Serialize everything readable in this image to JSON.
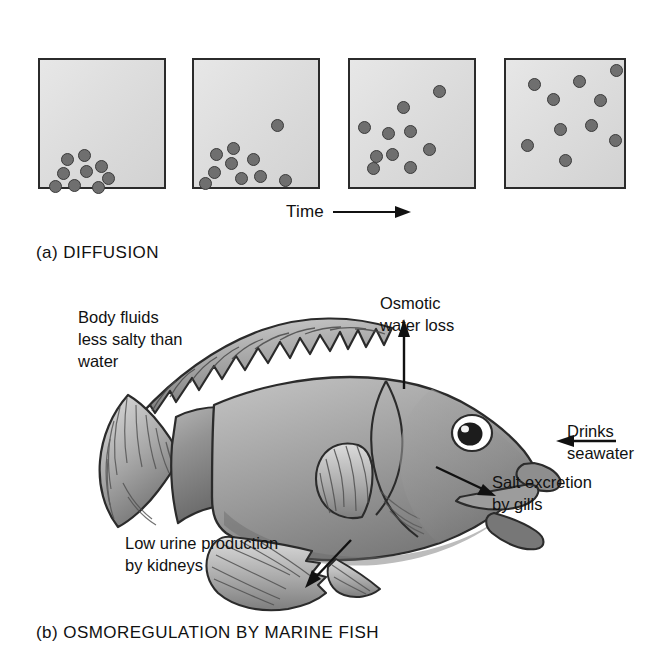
{
  "figure": {
    "panels": [
      {
        "id": "a",
        "caption": "(a) DIFFUSION",
        "time_axis": {
          "label": "Time",
          "arrow_icon": "arrow-right-icon"
        },
        "boxes": [
          {
            "index": 1,
            "particle_count": 9,
            "particles": [
              {
                "x": 21,
                "y": 93
              },
              {
                "x": 38,
                "y": 89
              },
              {
                "x": 17,
                "y": 107
              },
              {
                "x": 40,
                "y": 105
              },
              {
                "x": 55,
                "y": 100
              },
              {
                "x": 62,
                "y": 112
              },
              {
                "x": 9,
                "y": 120
              },
              {
                "x": 28,
                "y": 119
              },
              {
                "x": 52,
                "y": 121
              }
            ]
          },
          {
            "index": 2,
            "particle_count": 10,
            "particles": [
              {
                "x": 77,
                "y": 59
              },
              {
                "x": 16,
                "y": 88
              },
              {
                "x": 33,
                "y": 82
              },
              {
                "x": 31,
                "y": 97
              },
              {
                "x": 53,
                "y": 93
              },
              {
                "x": 14,
                "y": 106
              },
              {
                "x": 41,
                "y": 112
              },
              {
                "x": 60,
                "y": 110
              },
              {
                "x": 5,
                "y": 117
              },
              {
                "x": 85,
                "y": 114
              }
            ]
          },
          {
            "index": 3,
            "particle_count": 10,
            "particles": [
              {
                "x": 83,
                "y": 25
              },
              {
                "x": 47,
                "y": 41
              },
              {
                "x": 8,
                "y": 61
              },
              {
                "x": 32,
                "y": 67
              },
              {
                "x": 54,
                "y": 65
              },
              {
                "x": 73,
                "y": 83
              },
              {
                "x": 20,
                "y": 90
              },
              {
                "x": 36,
                "y": 88
              },
              {
                "x": 17,
                "y": 102
              },
              {
                "x": 54,
                "y": 101
              }
            ]
          },
          {
            "index": 4,
            "particle_count": 10,
            "particles": [
              {
                "x": 104,
                "y": 4
              },
              {
                "x": 22,
                "y": 18
              },
              {
                "x": 67,
                "y": 15
              },
              {
                "x": 41,
                "y": 33
              },
              {
                "x": 88,
                "y": 34
              },
              {
                "x": 48,
                "y": 63
              },
              {
                "x": 79,
                "y": 59
              },
              {
                "x": 103,
                "y": 74
              },
              {
                "x": 15,
                "y": 79
              },
              {
                "x": 53,
                "y": 94
              }
            ]
          }
        ]
      },
      {
        "id": "b",
        "caption": "(b) OSMOREGULATION BY MARINE FISH",
        "callouts": [
          {
            "name": "body-fluids",
            "text": "Body fluids\nless salty than\nwater"
          },
          {
            "name": "osmotic-loss",
            "text": "Osmotic\nwater loss"
          },
          {
            "name": "drinks",
            "text": "Drinks\nseawater"
          },
          {
            "name": "salt-gills",
            "text": "Salt excretion\nby gills"
          },
          {
            "name": "urine",
            "text": "Low urine production\nby kidneys"
          }
        ]
      }
    ]
  },
  "colors": {
    "ink": "#111111",
    "outline": "#2b2b2b",
    "particle_fill": "#6f6f6f",
    "particle_stroke": "#3a3a3a",
    "box_fill_light": "#e7e7e7",
    "box_fill_dark": "#d2d2d2",
    "fish_body_light": "#b9b9b9",
    "fish_body_dark": "#6e6e6e",
    "fin_light": "#d9d9d9",
    "fin_dark": "#8a8a8a",
    "background": "#ffffff"
  }
}
